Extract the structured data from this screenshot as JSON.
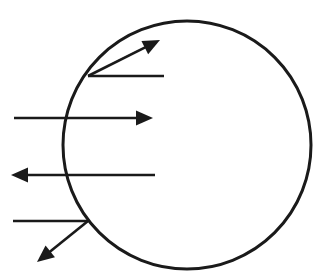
{
  "canvas": {
    "width": 322,
    "height": 280,
    "background_color": "#ffffff",
    "title": "circle-with-incident-and-reflected-rays"
  },
  "style": {
    "ink_color": "#1a1a1a",
    "circle_stroke_width": 3,
    "ray_stroke_width": 2.6
  },
  "diagram": {
    "type": "ray-diagram",
    "circle": {
      "label": "circle-outline",
      "cx": 187,
      "cy": 145,
      "r": 124
    },
    "rays": [
      {
        "id": "ray-upper-incident",
        "label": "upper incident ray",
        "kind": "segment",
        "x1": 88,
        "y1": 76,
        "x2": 164,
        "y2": 76,
        "arrowhead": "none"
      },
      {
        "id": "ray-upper-deflected",
        "label": "upper deflected ray",
        "kind": "arrow",
        "x1": 88,
        "y1": 76,
        "x2": 160,
        "y2": 40,
        "arrowhead": "end"
      },
      {
        "id": "ray-middle-through",
        "label": "middle ray passing through",
        "kind": "arrow",
        "x1": 14,
        "y1": 118,
        "x2": 153,
        "y2": 118,
        "arrowhead": "end"
      },
      {
        "id": "ray-left-pointing",
        "label": "left pointing ray",
        "kind": "arrow",
        "x1": 155,
        "y1": 175,
        "x2": 11,
        "y2": 175,
        "arrowhead": "end"
      },
      {
        "id": "ray-lower-incident",
        "label": "lower incident ray",
        "kind": "segment",
        "x1": 13,
        "y1": 221,
        "x2": 88,
        "y2": 221,
        "arrowhead": "none"
      },
      {
        "id": "ray-lower-deflected",
        "label": "lower deflected ray",
        "kind": "arrow",
        "x1": 88,
        "y1": 221,
        "x2": 37,
        "y2": 262,
        "arrowhead": "end"
      }
    ]
  }
}
